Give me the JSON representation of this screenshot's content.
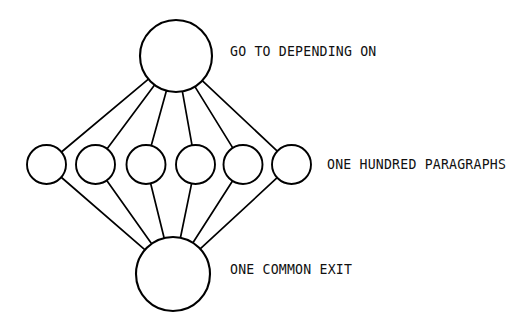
{
  "diagram": {
    "type": "node-link-fan",
    "canvas": {
      "width": 525,
      "height": 327,
      "background": "#ffffff"
    },
    "stroke_color": "#000000",
    "text_color": "#111111",
    "nodes": {
      "entry": {
        "id": "entry-node",
        "label": "",
        "cx": 176,
        "cy": 56,
        "r": 36
      },
      "middle": [
        {
          "id": "paragraph-node-1",
          "cx": 46.5,
          "cy": 164.5,
          "r": 19.5
        },
        {
          "id": "paragraph-node-2",
          "cx": 95.5,
          "cy": 164.5,
          "r": 19.5
        },
        {
          "id": "paragraph-node-3",
          "cx": 146.0,
          "cy": 164.5,
          "r": 19.5
        },
        {
          "id": "paragraph-node-4",
          "cx": 195.5,
          "cy": 164.5,
          "r": 19.5
        },
        {
          "id": "paragraph-node-5",
          "cx": 243.0,
          "cy": 164.5,
          "r": 19.5
        },
        {
          "id": "paragraph-node-6",
          "cx": 291.5,
          "cy": 164.5,
          "r": 19.5
        }
      ],
      "exit": {
        "id": "exit-node",
        "label": "",
        "cx": 173,
        "cy": 274,
        "r": 37
      }
    },
    "labels": {
      "top": {
        "text": "GO TO DEPENDING ON",
        "x": 230,
        "y": 52
      },
      "middle": {
        "text": "ONE HUNDRED PARAGRAPHS",
        "x": 327,
        "y": 164.5
      },
      "bottom": {
        "text": "ONE COMMON EXIT",
        "x": 230,
        "y": 270
      }
    }
  }
}
